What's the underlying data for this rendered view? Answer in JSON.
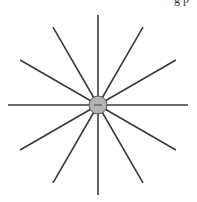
{
  "top_text": "g    p",
  "diagram": {
    "type": "radial-spokes",
    "center": {
      "x": 98,
      "y": 105
    },
    "spoke_count": 12,
    "spoke_length": 90,
    "spoke_color": "#3a3a3a",
    "hub": {
      "radius": 9,
      "fill": "#b4b4b4",
      "stroke": "#555555",
      "symbol": "−"
    }
  }
}
